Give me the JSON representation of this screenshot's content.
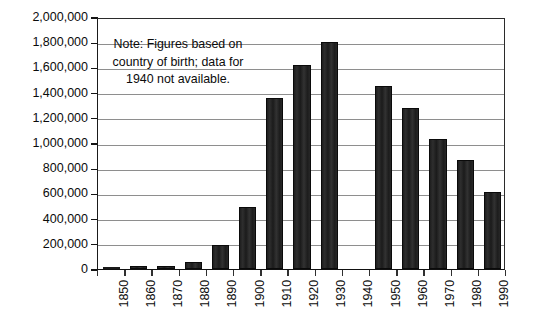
{
  "chart_data": {
    "type": "bar",
    "title": "",
    "subtitle": "",
    "xlabel": "",
    "ylabel": "",
    "categories": [
      "1850",
      "1860",
      "1870",
      "1880",
      "1890",
      "1900",
      "1910",
      "1920",
      "1930",
      "1940",
      "1950",
      "1960",
      "1970",
      "1980",
      "1990"
    ],
    "values": [
      10000,
      20000,
      25000,
      55000,
      190000,
      490000,
      1360000,
      1620000,
      1800000,
      null,
      1450000,
      1280000,
      1035000,
      865000,
      610000
    ],
    "ylim": [
      0,
      2000000
    ],
    "ytick_labels": [
      "0",
      "200,000",
      "400,000",
      "600,000",
      "800,000",
      "1,000,000",
      "1,200,000",
      "1,400,000",
      "1,600,000",
      "1,800,000",
      "2,000,000"
    ],
    "ytick_values": [
      0,
      200000,
      400000,
      600000,
      800000,
      1000000,
      1200000,
      1400000,
      1600000,
      1800000,
      2000000
    ],
    "ytick_step": 200000,
    "grid": true,
    "grid_axis": "y",
    "legend": false,
    "legend_position": "none",
    "missing_categories": [
      "1940"
    ],
    "bar_color": "#262626",
    "gridline_color": "#8e8e8e",
    "axis_color": "#111111",
    "annotations": [
      {
        "name": "note",
        "lines": [
          "Note: Figures based on",
          "country of birth; data for",
          "1940 not available."
        ]
      }
    ]
  }
}
